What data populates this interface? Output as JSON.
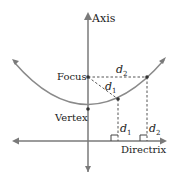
{
  "diagram": {
    "labels": {
      "axis": "Axis",
      "focus": "Focus",
      "vertex": "Vertex",
      "directrix": "Directrix",
      "d1_diag": "d",
      "d1_vert": "d",
      "d2_top": "d",
      "d2_vert": "d",
      "sub1": "1",
      "sub2": "2"
    },
    "colors": {
      "curve": "#8a8a8a",
      "line": "#7a7a7a",
      "dash": "#555555"
    }
  }
}
